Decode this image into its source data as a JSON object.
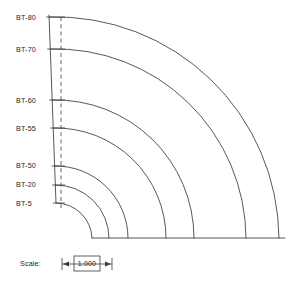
{
  "drawing": {
    "type": "quarter-annulus-section",
    "background_color": "#ffffff",
    "line_color": "#3a3a3a",
    "labels": [
      {
        "id": "bt-80",
        "text": "BT-80",
        "label_x": 16,
        "label_y": 20,
        "tick_y": 17,
        "radius": 223
      },
      {
        "id": "bt-70",
        "text": "BT-70",
        "label_x": 16,
        "label_y": 52,
        "tick_y": 49,
        "radius": 190
      },
      {
        "id": "bt-60",
        "text": "BT-60",
        "label_x": 16,
        "label_y": 103,
        "tick_y": 100,
        "radius": 138
      },
      {
        "id": "bt-55",
        "text": "BT-55",
        "label_x": 16,
        "label_y": 131,
        "tick_y": 128,
        "radius": 110
      },
      {
        "id": "bt-50",
        "text": "BT-50",
        "label_x": 16,
        "label_y": 168,
        "tick_y": 166,
        "radius": 72
      },
      {
        "id": "bt-20",
        "text": "BT-20",
        "label_x": 16,
        "label_y": 187,
        "tick_y": 185,
        "radius": 53
      },
      {
        "id": "bt-5",
        "text": "BT-5",
        "label_x": 16,
        "label_y": 206,
        "tick_y": 203,
        "radius": 36
      }
    ],
    "geometry": {
      "center_x": 56,
      "center_y": 238,
      "baseline_y": 238,
      "baseline_x_start": 92,
      "baseline_x_end": 285,
      "left_edge_top_x": 49,
      "left_edge_top_y": 15,
      "left_edge_bottom_x": 56,
      "left_edge_bottom_y": 203,
      "dashed_line_x": 61,
      "dashed_line_top_y": 17,
      "dashed_line_bottom_y": 210
    }
  },
  "scale": {
    "label": "Scale:",
    "value": "1.000",
    "label_x": 20,
    "label_y": 266,
    "dim_left_x": 62,
    "dim_right_x": 112,
    "dim_y": 264,
    "box_x": 74,
    "box_y": 256,
    "box_w": 26,
    "box_h": 15
  }
}
